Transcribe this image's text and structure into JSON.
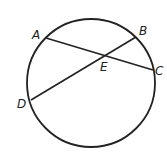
{
  "diagram": {
    "stroke_color": "#222222",
    "circle": {
      "cx": 91,
      "cy": 83,
      "r": 64
    },
    "points": {
      "A": {
        "label": "A",
        "x": 46,
        "y": 38,
        "lx": 32,
        "ly": 39
      },
      "B": {
        "label": "B",
        "x": 136,
        "y": 37,
        "lx": 139,
        "ly": 35
      },
      "C": {
        "label": "C",
        "x": 153,
        "y": 70,
        "lx": 155,
        "ly": 75
      },
      "D": {
        "label": "D",
        "x": 31,
        "y": 100,
        "lx": 17,
        "ly": 108
      },
      "E": {
        "label": "E",
        "x": 104,
        "y": 55,
        "lx": 100,
        "ly": 71
      }
    },
    "chords": [
      {
        "name": "AC",
        "from": "A",
        "to": "C"
      },
      {
        "name": "BD",
        "from": "B",
        "to": "D"
      }
    ]
  }
}
